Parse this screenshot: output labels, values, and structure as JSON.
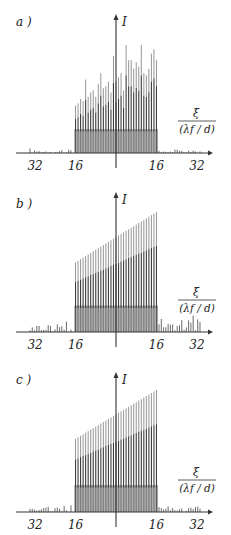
{
  "figure": {
    "axis_y_label": "I",
    "axis_x_label_num": "ξ",
    "axis_x_label_den": "(λf / d)"
  },
  "chart_data": [
    {
      "type": "bar",
      "panel_label": "a )",
      "title": "",
      "xlabel": "ξ / (λf/d)",
      "ylabel": "I",
      "x_tick_labels": [
        "32",
        "16",
        "16",
        "32"
      ],
      "x_tick_positions": [
        -32,
        -16,
        16,
        32
      ],
      "xlim": [
        -40,
        40
      ],
      "ylim": [
        0,
        1
      ],
      "grid": false,
      "description": "Irregular comb of spectral lines between -16 and +16 with randomly varying peak heights; weak side lobes outside",
      "main_lines": {
        "x_range": [
          -16,
          16
        ],
        "count": 33,
        "peak_heights": [
          0.44,
          0.46,
          0.5,
          0.48,
          0.68,
          0.52,
          0.56,
          0.58,
          0.52,
          0.64,
          0.74,
          0.6,
          0.62,
          0.66,
          0.56,
          0.9,
          0.66,
          0.7,
          0.74,
          0.58,
          1.0,
          0.86,
          0.86,
          0.78,
          0.84,
          0.8,
          1.0,
          0.74,
          0.72,
          0.78,
          0.92,
          0.96,
          0.86
        ]
      },
      "side_lobes": {
        "left_max": 0.05,
        "right_max": 0.04
      }
    },
    {
      "type": "bar",
      "panel_label": "b )",
      "title": "",
      "xlabel": "ξ / (λf/d)",
      "ylabel": "I",
      "x_tick_labels": [
        "32",
        "16",
        "16",
        "32"
      ],
      "x_tick_positions": [
        -32,
        -16,
        16,
        32
      ],
      "xlim": [
        -40,
        40
      ],
      "ylim": [
        0,
        1
      ],
      "grid": false,
      "description": "Regular comb of lines between -16 and +16 with linearly increasing peak height; irregular side lobes",
      "main_lines": {
        "x_range": [
          -16,
          16
        ],
        "count": 33,
        "peak_start": 0.58,
        "peak_end": 1.0
      },
      "side_lobes": {
        "left_max": 0.12,
        "right_max": 0.2
      }
    },
    {
      "type": "bar",
      "panel_label": "c )",
      "title": "",
      "xlabel": "ξ / (λf/d)",
      "ylabel": "I",
      "x_tick_labels": [
        "32",
        "16",
        "16",
        "32"
      ],
      "x_tick_positions": [
        -32,
        -16,
        16,
        32
      ],
      "xlim": [
        -40,
        40
      ],
      "ylim": [
        0,
        1
      ],
      "grid": false,
      "description": "Regular comb of lines between -16 and +16 with linearly increasing peak height; weak side lobes",
      "main_lines": {
        "x_range": [
          -16,
          16
        ],
        "count": 33,
        "peak_start": 0.6,
        "peak_end": 1.0
      },
      "side_lobes": {
        "left_max": 0.08,
        "right_max": 0.07
      }
    }
  ]
}
